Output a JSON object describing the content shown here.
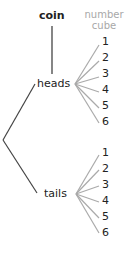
{
  "headers": {
    "coin": "coin",
    "number_cube_line1": "number",
    "number_cube_line2": "cube"
  },
  "outcomes": {
    "heads": "heads",
    "tails": "tails"
  },
  "heads_numbers": [
    "1",
    "2",
    "3",
    "4",
    "5",
    "6"
  ],
  "tails_numbers": [
    "1",
    "2",
    "3",
    "4",
    "5",
    "6"
  ],
  "colors": {
    "coin_lines": "#444444",
    "cube_lines": "#aaaaaa",
    "header_number": "#a8a8a8",
    "text": "#222222"
  }
}
